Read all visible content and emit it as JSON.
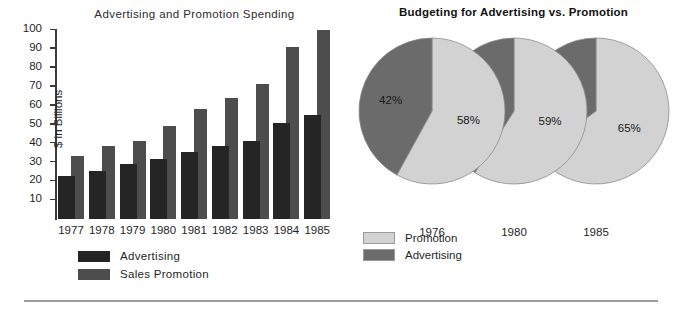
{
  "bar_chart": {
    "title": "Advertising and Promotion Spending",
    "ylabel": "$ in Billions",
    "legend": [
      {
        "label": "Advertising",
        "swatch": "#252525"
      },
      {
        "label": "Sales Promotion",
        "swatch": "#4d4d4d"
      }
    ]
  },
  "pie_chart": {
    "title": "Budgeting for Advertising vs. Promotion",
    "legend": [
      {
        "label": "Promotion",
        "swatch": "#d2d2d2"
      },
      {
        "label": "Advertising",
        "swatch": "#6b6b6b"
      }
    ]
  },
  "chart_data": [
    {
      "type": "bar",
      "title": "Advertising and Promotion Spending",
      "xlabel": "",
      "ylabel": "$ in Billions",
      "ylim": [
        0,
        100
      ],
      "yticks": [
        10,
        20,
        30,
        40,
        50,
        60,
        70,
        80,
        90,
        100
      ],
      "grid": false,
      "legend_position": "below-left",
      "categories": [
        "1977",
        "1978",
        "1979",
        "1980",
        "1981",
        "1982",
        "1983",
        "1984",
        "1985"
      ],
      "series": [
        {
          "name": "Advertising",
          "color": "#252525",
          "values": [
            23,
            25.5,
            29,
            32,
            35.5,
            38.5,
            41.5,
            51,
            55
          ]
        },
        {
          "name": "Sales Promotion",
          "color": "#4d4d4d",
          "values": [
            33.5,
            38.5,
            41.5,
            49,
            58,
            64,
            71.5,
            91,
            100
          ]
        }
      ]
    },
    {
      "type": "pie",
      "title": "Budgeting for Advertising vs. Promotion",
      "legend_position": "below-left",
      "pies": [
        {
          "year": "1976",
          "slices": [
            {
              "name": "Promotion",
              "value": 58,
              "label": "58%",
              "color": "#d2d2d2"
            },
            {
              "name": "Advertising",
              "value": 42,
              "label": "42%",
              "color": "#6b6b6b"
            }
          ]
        },
        {
          "year": "1980",
          "slices": [
            {
              "name": "Promotion",
              "value": 59,
              "label": "59%",
              "color": "#d2d2d2"
            },
            {
              "name": "Advertising",
              "value": 41,
              "label": "41%",
              "color": "#6b6b6b"
            }
          ]
        },
        {
          "year": "1985",
          "slices": [
            {
              "name": "Promotion",
              "value": 65,
              "label": "65%",
              "color": "#d2d2d2"
            },
            {
              "name": "Advertising",
              "value": 35,
              "label": "35%",
              "color": "#6b6b6b"
            }
          ]
        }
      ]
    }
  ]
}
